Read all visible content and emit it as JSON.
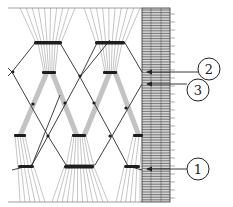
{
  "diagram": {
    "colors": {
      "ink": "#2a2a2a",
      "fiber": "#8a8a8a",
      "fiber_light": "#b8b8b8",
      "band_fill": "#d6d6d6",
      "background": "#ffffff"
    },
    "callouts": [
      {
        "id": "2",
        "label": "2",
        "cx": 209,
        "cy": 69,
        "arrow_y": 72
      },
      {
        "id": "3",
        "label": "3",
        "cx": 198,
        "cy": 90,
        "arrow_y": 84
      },
      {
        "id": "1",
        "label": "1",
        "cx": 198,
        "cy": 169,
        "arrow_y": 169
      }
    ]
  }
}
